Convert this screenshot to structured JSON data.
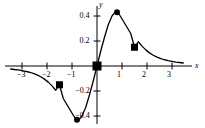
{
  "chart_data": {
    "type": "line",
    "title": "",
    "subtitle": "",
    "xlabel": "x",
    "ylabel": "y",
    "xlim": [
      -3.45,
      3.45
    ],
    "ylim": [
      -0.52,
      0.5
    ],
    "grid": false,
    "legend": null,
    "xticks": [
      -3,
      -2,
      -1,
      1,
      2,
      3
    ],
    "xticklabels": [
      "−3",
      "−2",
      "−1",
      "1",
      "2",
      "3"
    ],
    "yticks": [
      0.4,
      0.2,
      -0.2,
      -0.4
    ],
    "yticklabels": [
      "0.4",
      "0.2",
      "−0.2",
      "−0.4"
    ],
    "series": [
      {
        "name": "curve",
        "style": "solid",
        "color": "#000000",
        "x": [
          -3.45,
          -3.3,
          -3.15,
          -3.0,
          -2.85,
          -2.7,
          -2.55,
          -2.4,
          -2.25,
          -2.1,
          -1.95,
          -1.8,
          -1.65,
          -1.5,
          -1.35,
          -1.2,
          -1.05,
          -0.9,
          -0.8,
          -0.7,
          -0.6,
          -0.45,
          -0.3,
          -0.15,
          0,
          0.15,
          0.3,
          0.45,
          0.6,
          0.7,
          0.8,
          0.9,
          1.05,
          1.2,
          1.35,
          1.5,
          1.65,
          1.8,
          1.95,
          2.1,
          2.25,
          2.4,
          2.55,
          2.7,
          2.85,
          3.0,
          3.15,
          3.3,
          3.45
        ],
        "y": [
          -0.024,
          -0.028,
          -0.031,
          -0.037,
          -0.043,
          -0.05,
          -0.059,
          -0.071,
          -0.086,
          -0.105,
          -0.129,
          -0.159,
          -0.194,
          -0.15,
          -0.26,
          -0.31,
          -0.36,
          -0.41,
          -0.43,
          -0.425,
          -0.4,
          -0.33,
          -0.23,
          -0.12,
          0.0,
          0.12,
          0.23,
          0.33,
          0.4,
          0.425,
          0.43,
          0.41,
          0.36,
          0.31,
          0.26,
          0.15,
          0.194,
          0.159,
          0.129,
          0.105,
          0.086,
          0.071,
          0.059,
          0.05,
          0.043,
          0.037,
          0.031,
          0.028,
          0.024
        ]
      }
    ],
    "markers": [
      {
        "shape": "square",
        "x": -1.5,
        "y": -0.15,
        "size": 7,
        "color": "#000000"
      },
      {
        "shape": "circle",
        "x": -0.8,
        "y": -0.43,
        "size": 6,
        "color": "#000000"
      },
      {
        "shape": "square",
        "x": 0,
        "y": 0,
        "size": 9,
        "color": "#000000"
      },
      {
        "shape": "circle",
        "x": 0.8,
        "y": 0.43,
        "size": 6,
        "color": "#000000"
      },
      {
        "shape": "square",
        "x": 1.5,
        "y": 0.15,
        "size": 7,
        "color": "#000000"
      }
    ],
    "axis_color": "#000000",
    "annotations": []
  }
}
